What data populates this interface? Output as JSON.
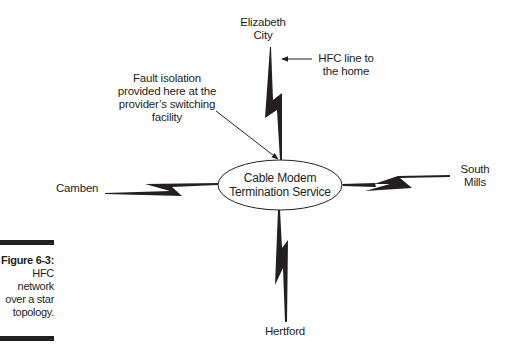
{
  "figure": {
    "number": "Figure 6-3:",
    "caption_lines": [
      "HFC",
      "network",
      "over a star",
      "topology."
    ]
  },
  "hub": {
    "lines": [
      "Cable Modem",
      "Termination Service"
    ]
  },
  "nodes": {
    "top": {
      "lines": [
        "Elizabeth",
        "City"
      ]
    },
    "left": {
      "lines": [
        "Camben"
      ]
    },
    "right": {
      "lines": [
        "South",
        "Mills"
      ]
    },
    "bottom": {
      "lines": [
        "Hertford"
      ]
    }
  },
  "annotations": {
    "hfc_line": {
      "lines": [
        "HFC line to",
        "the home"
      ]
    },
    "fault_isolation": {
      "lines": [
        "Fault isolation",
        "provided here at the",
        "provider’s switching",
        "facility"
      ]
    }
  },
  "colors": {
    "ink": "#231f20",
    "background": "#ffffff"
  }
}
